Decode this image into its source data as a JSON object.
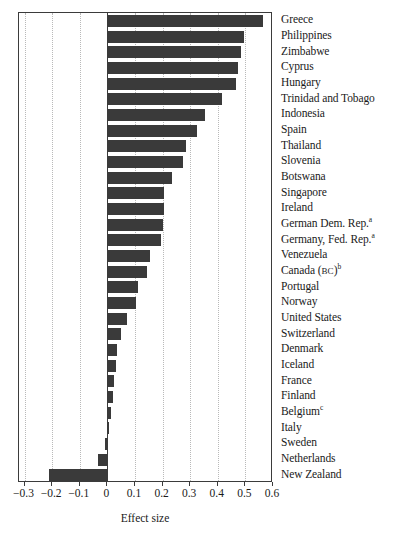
{
  "chart_data": {
    "type": "bar",
    "orientation": "horizontal",
    "title": "",
    "subtitle": "",
    "xlabel": "Effect size",
    "ylabel": "",
    "xlim": [
      -0.32,
      0.6
    ],
    "ylim": null,
    "grid": true,
    "grid_axis": "x",
    "grid_style": "dotted",
    "legend": null,
    "legend_position": "none",
    "bar_color": "#3a3a3a",
    "axis_color": "#3b3b3b",
    "xticks": [
      -0.3,
      -0.2,
      -0.1,
      0,
      0.1,
      0.2,
      0.3,
      0.4,
      0.5,
      0.6
    ],
    "xtick_labels": [
      "−0.3",
      "−0.2",
      "−0.1",
      "0",
      "0.1",
      "0.2",
      "0.3",
      "0.4",
      "0.5",
      "0.6"
    ],
    "categories": [
      "Greece",
      "Philippines",
      "Zimbabwe",
      "Cyprus",
      "Hungary",
      "Trinidad and Tobago",
      "Indonesia",
      "Spain",
      "Thailand",
      "Slovenia",
      "Botswana",
      "Singapore",
      "Ireland",
      "German Dem. Rep.",
      "Germany, Fed. Rep.",
      "Venezuela",
      "Canada (BC)",
      "Portugal",
      "Norway",
      "United States",
      "Switzerland",
      "Denmark",
      "Iceland",
      "France",
      "Finland",
      "Belgium",
      "Italy",
      "Sweden",
      "Netherlands",
      "New Zealand"
    ],
    "values": [
      0.565,
      0.495,
      0.485,
      0.475,
      0.465,
      0.415,
      0.355,
      0.325,
      0.285,
      0.275,
      0.235,
      0.205,
      0.205,
      0.2,
      0.195,
      0.155,
      0.145,
      0.11,
      0.105,
      0.07,
      0.05,
      0.035,
      0.03,
      0.025,
      0.02,
      0.015,
      0.005,
      -0.01,
      -0.035,
      -0.21
    ],
    "footnote_markers": {
      "German Dem. Rep.": "a",
      "Germany, Fed. Rep.": "a",
      "Canada (BC)": "b",
      "Belgium": "c"
    }
  },
  "axis": {
    "x_title": "Effect size"
  }
}
